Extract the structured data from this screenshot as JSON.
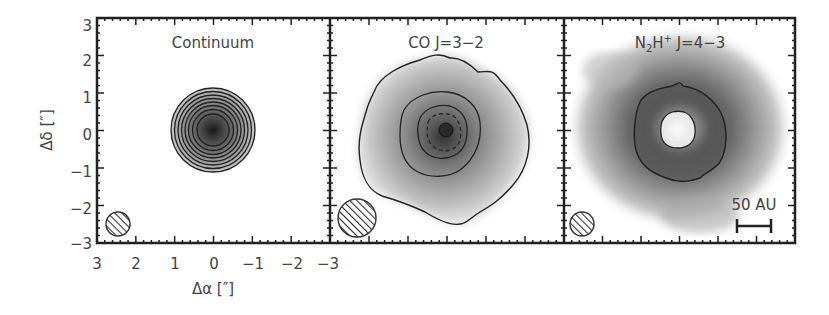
{
  "figure": {
    "type": "astronomical-map-panels",
    "panels": [
      {
        "title": "Continuum",
        "title_main": "Continuum",
        "title_sub": "",
        "title_sup": "",
        "title_tail": "",
        "beam_size": "small"
      },
      {
        "title": "CO J=3-2",
        "title_main": "CO J=3−2",
        "title_sub": "",
        "title_sup": "",
        "title_tail": "",
        "beam_size": "large"
      },
      {
        "title": "N2H+ J=4-3",
        "title_main": "N",
        "title_sub": "2",
        "title_mid": "H",
        "title_sup": "+",
        "title_tail": " J=4−3",
        "beam_size": "small",
        "scale_bar_label": "50 AU"
      }
    ],
    "y_axis": {
      "label": "Δδ [″]",
      "ticks": [
        "3",
        "2",
        "1",
        "0",
        "−1",
        "−2",
        "−3"
      ]
    },
    "x_axis": {
      "label": "Δα [″]",
      "ticks": [
        "3",
        "2",
        "1",
        "0",
        "−1",
        "−2",
        "−3"
      ]
    },
    "scale_bar": "50 AU"
  },
  "chart_data": [
    {
      "type": "heatmap",
      "title": "Continuum",
      "xlabel": "Δα [″]",
      "ylabel": "Δδ [″]",
      "xlim": [
        3,
        -3
      ],
      "ylim": [
        -3,
        3
      ],
      "x_ticks": [
        3,
        2,
        1,
        0,
        -1,
        -2,
        -3
      ],
      "y_ticks": [
        -3,
        -2,
        -1,
        0,
        1,
        2,
        3
      ],
      "description": "Compact centrally peaked emission at (0,0), ~10 concentric circular contours out to radius ~1.2″",
      "contour_count": 10,
      "beam": {
        "x": 2.6,
        "y": -2.6,
        "diameter_arcsec": 0.5
      }
    },
    {
      "type": "heatmap",
      "title": "CO J=3-2",
      "xlim": [
        3,
        -3
      ],
      "ylim": [
        -3,
        3
      ],
      "description": "Extended emission to radius ~2.5″ peaked at center; 3 solid contours plus dashed inner contour",
      "contour_count": 4,
      "beam": {
        "x": 2.4,
        "y": -2.4,
        "diameter_arcsec": 1.0
      }
    },
    {
      "type": "heatmap",
      "title": "N2H+ J=4-3",
      "xlim": [
        3,
        -3
      ],
      "ylim": [
        -3,
        3
      ],
      "description": "Ring-like emission with central depression at (0,0); diffuse emission extends to ~2.8″; 2 contours (outer ring ~1.2″, inner hole ~0.5″)",
      "contour_count": 2,
      "beam": {
        "x": 2.6,
        "y": -2.6,
        "diameter_arcsec": 0.6
      },
      "scale_bar": {
        "label": "50 AU",
        "length_arcsec": 0.9
      }
    }
  ]
}
